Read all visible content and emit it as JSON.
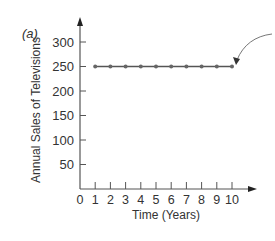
{
  "panel_label": "(a)",
  "chart_data": {
    "type": "line",
    "title": "",
    "xlabel": "Time (Years)",
    "ylabel": "Annual Sales of Televisions",
    "x": [
      1,
      2,
      3,
      4,
      5,
      6,
      7,
      8,
      9,
      10
    ],
    "series": [
      {
        "name": "Annual Sales",
        "values": [
          250,
          250,
          250,
          250,
          250,
          250,
          250,
          250,
          250,
          250
        ]
      }
    ],
    "x_ticks": [
      "0",
      "1",
      "2",
      "3",
      "4",
      "5",
      "6",
      "7",
      "8",
      "9",
      "10"
    ],
    "y_ticks": [
      "50",
      "100",
      "150",
      "200",
      "250",
      "300"
    ],
    "xlim": [
      0,
      10.5
    ],
    "ylim": [
      0,
      330
    ],
    "grid": false,
    "legend": null,
    "annotations": [
      {
        "type": "curved-arrow",
        "points_to": {
          "x": 10,
          "y": 250
        },
        "text": ""
      }
    ],
    "colors": {
      "line": "#555555",
      "axis": "#555555",
      "marker": "#666666"
    }
  }
}
